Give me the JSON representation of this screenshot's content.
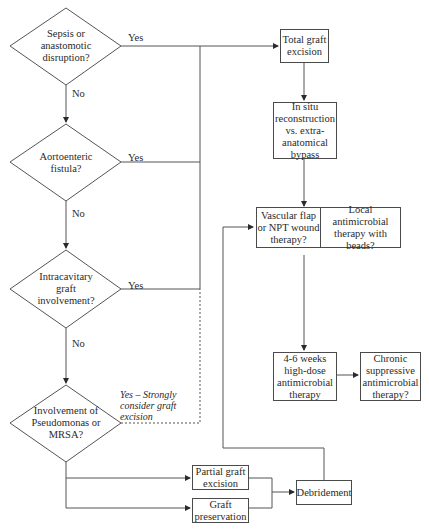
{
  "decisions": [
    {
      "id": "d1",
      "text": "Sepsis or anastomotic disruption?",
      "yes": "Yes",
      "no": "No"
    },
    {
      "id": "d2",
      "text": "Aortoenteric fistula?",
      "yes": "Yes",
      "no": "No"
    },
    {
      "id": "d3",
      "text": "Intracavitary graft involvement?",
      "yes": "Yes",
      "no": "No"
    },
    {
      "id": "d4",
      "text": "Involvement of Pseudomonas or MRSA?",
      "yes": "Yes – Strongly consider graft excision"
    }
  ],
  "boxes": {
    "total_excision": "Total graft excision",
    "reconstruction": "In situ reconstruction vs. extra-anatomical bypass",
    "vascular_flap": "Vascular flap or NPT wound therapy?",
    "local_antimicrobial": "Local antimicrobial therapy with beads?",
    "high_dose": "4-6 weeks high-dose antimicrobial therapy",
    "chronic": "Chronic suppressive antimicrobial therapy?",
    "partial_excision": "Partial graft excision",
    "preservation": "Graft preservation",
    "debridement": "Debridement"
  }
}
